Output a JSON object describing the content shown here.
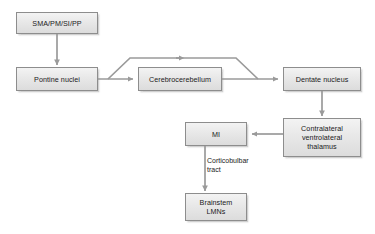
{
  "diagram": {
    "background_color": "#ffffff",
    "node_fill_color": "#e8e8e8",
    "node_border_color": "#8d8d8d",
    "connector_color": "#9a9a9a",
    "text_color": "#1a1a1a",
    "nodes": [
      {
        "id": "sma",
        "label": "SMA/PM/SI/PP"
      },
      {
        "id": "pontine",
        "label": "Pontine nuclei"
      },
      {
        "id": "cerebro",
        "label": "Cerebrocerebellum"
      },
      {
        "id": "dentate",
        "label": "Dentate nucleus"
      },
      {
        "id": "thalamus",
        "label": "Contralateral\nventrolateral\nthalamus"
      },
      {
        "id": "mi",
        "label": "MI"
      },
      {
        "id": "brainstem",
        "label": "Brainstem\nLMNs"
      }
    ],
    "edge_labels": [
      {
        "id": "corticobulbar",
        "label": "Corticobulbar\ntract"
      }
    ],
    "connections": [
      {
        "from": "sma",
        "to": "pontine",
        "direction": "down"
      },
      {
        "from": "pontine",
        "to": "cerebro",
        "direction": "right"
      },
      {
        "from": "pontine",
        "to": "dentate",
        "direction": "right-bypass-over-cerebrocerebellum"
      },
      {
        "from": "cerebro",
        "to": "dentate",
        "direction": "right"
      },
      {
        "from": "dentate",
        "to": "thalamus",
        "direction": "down"
      },
      {
        "from": "thalamus",
        "to": "mi",
        "direction": "left"
      },
      {
        "from": "mi",
        "to": "brainstem",
        "direction": "down",
        "label": "corticobulbar"
      }
    ]
  }
}
